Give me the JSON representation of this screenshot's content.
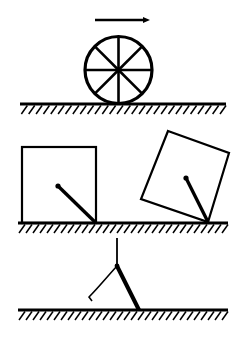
{
  "figure": {
    "background_color": "#ffffff",
    "ink_color": "#000000",
    "width": 245,
    "height": 347
  },
  "panels": [
    {
      "id": "panel-wheel",
      "name": "rolling-wheel-panel",
      "caption": "Spoked wheel rolling to the right on hatched ground",
      "elements": {
        "direction_arrow": {
          "name": "direction-arrow",
          "label": "motion direction arrow",
          "points_to": "right",
          "x1": 95,
          "y1": 20,
          "x2": 150,
          "y2": 20,
          "stroke_width": 2.6,
          "head_length": 7,
          "head_width": 6
        },
        "wheel": {
          "name": "wheel",
          "label": "spoked wheel",
          "cx": 118.5,
          "cy": 70,
          "r": 33.5,
          "rim_stroke_width": 3.2,
          "spoke_count": 8,
          "spoke_stroke_width": 2.6,
          "spoke_angles_deg": [
            0,
            45,
            90,
            135,
            180,
            225,
            270,
            315
          ],
          "hub_r": 2.6
        },
        "ground": {
          "name": "ground-hatched-line-1",
          "label": "hatched ground surface",
          "x1": 20,
          "x2": 226,
          "y": 104,
          "line_stroke_width": 3.0,
          "hatch_count": 28,
          "hatch_dx": -6,
          "hatch_dy": 10,
          "hatch_stroke_width": 1.5
        }
      }
    },
    {
      "id": "panel-blocks",
      "name": "tipping-block-panel",
      "caption": "Upright block and the same block tipped about its lower right corner",
      "elements": {
        "upright_block": {
          "name": "upright-block",
          "label": "block at rest",
          "x": 22,
          "y": 147,
          "w": 74,
          "h": 76,
          "stroke_width": 2.2,
          "radius_line": {
            "name": "upright-block-radius-line",
            "label": "line from centre to pivot corner",
            "x1": 58,
            "y1": 186,
            "x2": 96,
            "y2": 223,
            "stroke_width": 3.4,
            "dot_r": 2.6
          }
        },
        "tipped_block": {
          "name": "tipped-block",
          "label": "block tipped about corner",
          "rotation_deg": -20,
          "corners": [
            {
              "x": 168,
              "y": 131
            },
            {
              "x": 229,
              "y": 153
            },
            {
              "x": 208,
              "y": 222
            },
            {
              "x": 141,
              "y": 199
            }
          ],
          "stroke_width": 2.2,
          "radius_line": {
            "name": "tipped-block-radius-line",
            "label": "line from centre to pivot corner",
            "x1": 186,
            "y1": 178,
            "x2": 208,
            "y2": 222,
            "stroke_width": 3.4,
            "dot_r": 2.6
          }
        },
        "ground": {
          "name": "ground-hatched-line-2",
          "label": "hatched ground surface",
          "x1": 18,
          "x2": 228,
          "y": 223,
          "line_stroke_width": 3.0,
          "hatch_count": 30,
          "hatch_dx": -6,
          "hatch_dy": 10,
          "hatch_stroke_width": 1.5
        }
      }
    },
    {
      "id": "panel-pivot",
      "name": "pivoting-rod-panel",
      "caption": "Rod pivoting at a point, shown in current and previous positions",
      "elements": {
        "support_line": {
          "name": "vertical-support-line",
          "label": "vertical reference line",
          "x1": 117,
          "y1": 238,
          "x2": 117,
          "y2": 265,
          "stroke_width": 1.8
        },
        "pivot_point": {
          "name": "pivot-point",
          "label": "pivot",
          "x": 117,
          "y": 266,
          "r": 2.4
        },
        "rod": {
          "name": "pivoting-rod",
          "label": "rod in current position",
          "x1": 117,
          "y1": 266,
          "x2": 139,
          "y2": 310,
          "stroke_width": 4.0
        },
        "previous_position": {
          "name": "previous-position-arc",
          "label": "rod previous position (thin curve)",
          "path": "M117,266 C106,278 98,288 89,297",
          "tick_x1": 89,
          "tick_y1": 297,
          "tick_x2": 92,
          "tick_y2": 301,
          "stroke_width": 1.6
        },
        "ground": {
          "name": "ground-hatched-line-3",
          "label": "hatched ground surface",
          "x1": 18,
          "x2": 228,
          "y": 310,
          "line_stroke_width": 3.0,
          "hatch_count": 30,
          "hatch_dx": -6,
          "hatch_dy": 10,
          "hatch_stroke_width": 1.5
        }
      }
    }
  ]
}
